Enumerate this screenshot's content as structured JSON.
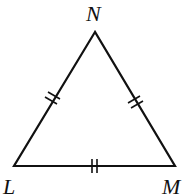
{
  "diagram": {
    "type": "equilateral-triangle",
    "vertices": {
      "N": {
        "label": "N",
        "x": 95,
        "y": 32
      },
      "L": {
        "label": "L",
        "x": 14,
        "y": 166
      },
      "M": {
        "label": "M",
        "x": 175,
        "y": 166
      }
    },
    "congruence_marks": {
      "LN": "double-tick",
      "NM": "double-tick",
      "LM": "double-tick"
    },
    "stroke_color": "#111111"
  }
}
